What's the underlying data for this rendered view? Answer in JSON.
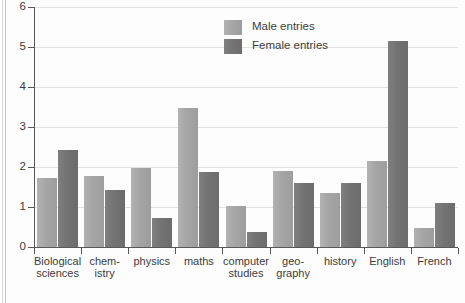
{
  "chart_data": {
    "type": "bar",
    "title": "",
    "subtitle": "",
    "xlabel": "",
    "ylabel": "",
    "ylim": [
      0,
      6
    ],
    "yticks": [
      0,
      1,
      2,
      3,
      4,
      5,
      6
    ],
    "ytick_labels": [
      "0",
      "1",
      "2",
      "3",
      "4",
      "5",
      "6"
    ],
    "grid": true,
    "legend_position": "top-center",
    "categories": [
      "Biological\nsciences",
      "chem-\nistry",
      "physics",
      "maths",
      "computer\nstudies",
      "geo-\ngraphy",
      "history",
      "English",
      "French"
    ],
    "series": [
      {
        "name": "Male entries",
        "color": "#a5a5a5",
        "values": [
          1.72,
          1.77,
          1.97,
          3.47,
          1.03,
          1.9,
          1.35,
          2.15,
          0.48
        ]
      },
      {
        "name": "Female entries",
        "color": "#737373",
        "values": [
          2.43,
          1.42,
          0.73,
          1.87,
          0.38,
          1.6,
          1.6,
          5.15,
          1.1
        ]
      }
    ]
  },
  "legend": {
    "items": [
      {
        "label": "Male entries"
      },
      {
        "label": "Female entries"
      }
    ]
  }
}
